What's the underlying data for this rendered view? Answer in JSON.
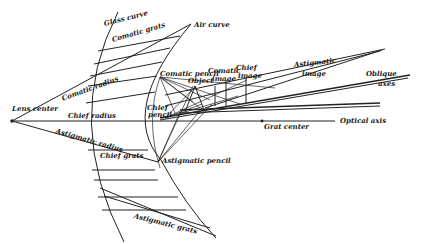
{
  "diagram": {
    "labels": {
      "glass_curve": "Glass curve",
      "comatic_grats": "Comatic grats",
      "air_curve": "Air curve",
      "lens_center": "Lens center",
      "comatic_radius": "Comatic radius",
      "chief_radius": "Chief radius",
      "astigmatic_radius": "Astigmatic radius",
      "chief_grats": "Chief grats",
      "astigmatic_grats": "Astigmatic grats",
      "comatic_pencil": "Comatic pencil",
      "chief_pencil_1": "Chief",
      "chief_pencil_2": "pencil",
      "object": "Object",
      "comatic_image_1": "Comatic",
      "comatic_image_2": "image",
      "chief_image_1": "Chief",
      "chief_image_2": "image",
      "astigmatic_image_1": "Astigmatic",
      "astigmatic_image_2": "image",
      "oblique_1": "Oblique",
      "oblique_2": "axes",
      "astigmatic_pencil": "Astigmatic pencil",
      "grat_center": "Grat center",
      "optical_axis": "Optical axis"
    },
    "colors": {
      "ink": "#222222",
      "paper": "#ffffff"
    }
  }
}
